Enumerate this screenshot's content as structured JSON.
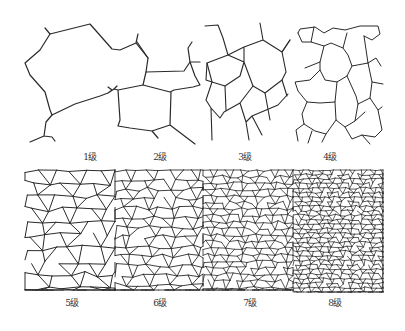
{
  "figure": {
    "line_color": "#2a2a2a",
    "background": "#ffffff",
    "panels": [
      {
        "grade": 1,
        "label": "1级",
        "row": 0,
        "x": 25,
        "y": 25,
        "w": 95,
        "h": 120,
        "label_x": 90,
        "label_y": 151
      },
      {
        "grade": 2,
        "label": "2级",
        "row": 0,
        "x": 110,
        "y": 25,
        "w": 90,
        "h": 120,
        "label_x": 160,
        "label_y": 151
      },
      {
        "grade": 3,
        "label": "3级",
        "row": 0,
        "x": 200,
        "y": 25,
        "w": 90,
        "h": 120,
        "label_x": 245,
        "label_y": 151
      },
      {
        "grade": 4,
        "label": "4级",
        "row": 0,
        "x": 290,
        "y": 25,
        "w": 95,
        "h": 120,
        "label_x": 330,
        "label_y": 151
      },
      {
        "grade": 5,
        "label": "5级",
        "row": 1,
        "x": 25,
        "y": 170,
        "w": 90,
        "h": 120,
        "label_x": 72,
        "label_y": 297
      },
      {
        "grade": 6,
        "label": "6级",
        "row": 1,
        "x": 115,
        "y": 170,
        "w": 88,
        "h": 120,
        "label_x": 160,
        "label_y": 297
      },
      {
        "grade": 7,
        "label": "7级",
        "row": 1,
        "x": 203,
        "y": 170,
        "w": 90,
        "h": 120,
        "label_x": 250,
        "label_y": 297
      },
      {
        "grade": 8,
        "label": "8级",
        "row": 1,
        "x": 293,
        "y": 170,
        "w": 90,
        "h": 122,
        "label_x": 335,
        "label_y": 297
      }
    ]
  }
}
